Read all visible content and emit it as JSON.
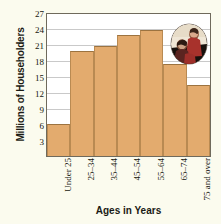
{
  "chart_data": {
    "type": "bar",
    "title": "",
    "xlabel": "Ages in Years",
    "ylabel": "Millions of Householders",
    "categories": [
      "Under 25",
      "25–34",
      "35–44",
      "45–54",
      "55–64",
      "65–74",
      "75 and over"
    ],
    "values": [
      6,
      20,
      21,
      23,
      24,
      17.5,
      13.5
    ],
    "ylim": [
      0,
      27
    ],
    "yticks": [
      3,
      6,
      9,
      12,
      15,
      18,
      21,
      24,
      27
    ],
    "ytick_labels": [
      "3",
      "6",
      "9",
      "12",
      "15",
      "18",
      "21",
      "24",
      "27"
    ],
    "grid": true,
    "legend": "none",
    "bar_color": "#e3ab6e",
    "bar_edge_color": "#9c7340",
    "grid_color": "#c9c9c9",
    "axis_color": "#6f6a5c",
    "plot_background": "#ffffff",
    "figure_background": "#fbfbee",
    "annotations": [
      {
        "name": "inset-photo",
        "description": "oval photograph of two seated people in red clothing",
        "position": "top-right inside plot"
      }
    ]
  }
}
